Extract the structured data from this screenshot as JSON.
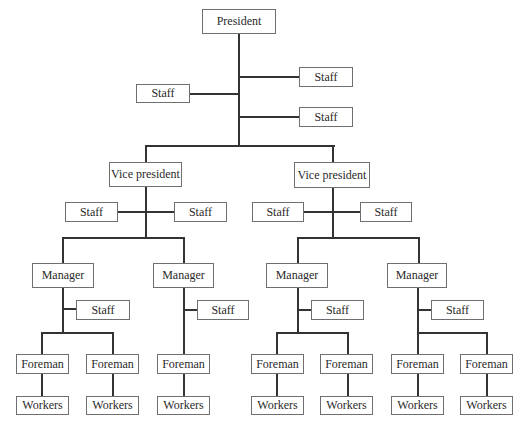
{
  "diagram": {
    "type": "organization-chart",
    "nodes": {
      "president": "President",
      "president_staff": [
        "Staff",
        "Staff",
        "Staff"
      ],
      "vice_presidents": [
        {
          "label": "Vice president",
          "staff": [
            "Staff",
            "Staff"
          ],
          "managers": [
            {
              "label": "Manager",
              "staff": "Staff",
              "foremen": [
                {
                  "label": "Foreman",
                  "workers": "Workers"
                },
                {
                  "label": "Foreman",
                  "workers": "Workers"
                }
              ]
            },
            {
              "label": "Manager",
              "staff": "Staff",
              "foremen": [
                {
                  "label": "Foreman",
                  "workers": "Workers"
                }
              ]
            }
          ]
        },
        {
          "label": "Vice president",
          "staff": [
            "Staff",
            "Staff"
          ],
          "managers": [
            {
              "label": "Manager",
              "staff": "Staff",
              "foremen": [
                {
                  "label": "Foreman",
                  "workers": "Workers"
                },
                {
                  "label": "Foreman",
                  "workers": "Workers"
                }
              ]
            },
            {
              "label": "Manager",
              "staff": "Staff",
              "foremen": [
                {
                  "label": "Foreman",
                  "workers": "Workers"
                },
                {
                  "label": "Foreman",
                  "workers": "Workers"
                }
              ]
            }
          ]
        }
      ]
    },
    "colors": {
      "line": "#333333",
      "border": "#6f6f6f",
      "background": "#ffffff"
    }
  }
}
